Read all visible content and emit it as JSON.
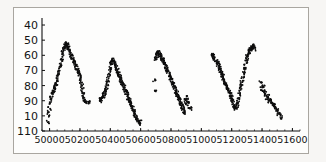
{
  "figure": {
    "background_color": "#f7f6f4",
    "plot_background_color": "#fdfdfc",
    "border_color": "#a9a6a0",
    "axis_color": "#111111",
    "point_color": "#0d0d0d"
  },
  "chart_data": {
    "type": "scatter",
    "title": "",
    "subtitle": "",
    "xlabel": "",
    "ylabel": "",
    "xlim": [
      49950,
      51650
    ],
    "ylim": [
      110,
      38
    ],
    "y_inverted": true,
    "grid": false,
    "legend": null,
    "annotations": [],
    "xticks": [
      50000,
      50200,
      50400,
      50600,
      50800,
      51000,
      51200,
      51400,
      51600
    ],
    "xticklabels": [
      "50000",
      "50200",
      "50400",
      "50600",
      "50800",
      "51000",
      "51200",
      "51400",
      "51600"
    ],
    "yticks": [
      40,
      50,
      60,
      70,
      80,
      90,
      100,
      110
    ],
    "yticklabels": [
      "40",
      "50",
      "60",
      "70",
      "80",
      "90",
      "10",
      "110"
    ],
    "series": [
      {
        "name": "light-curve",
        "marker": "dot",
        "marker_size": 1.6,
        "color": "#0d0d0d",
        "x": [
          49990,
          49993,
          49996,
          50000,
          50004,
          50008,
          50012,
          50016,
          50020,
          50024,
          50028,
          50032,
          50036,
          50040,
          50044,
          50048,
          50052,
          50056,
          50060,
          50064,
          50068,
          50072,
          50076,
          50080,
          50084,
          50088,
          50092,
          50096,
          50100,
          50104,
          50108,
          50112,
          50116,
          50120,
          50124,
          50128,
          50132,
          50136,
          50140,
          50144,
          50148,
          50152,
          50156,
          50160,
          50164,
          50168,
          50172,
          50176,
          50180,
          50184,
          50188,
          50192,
          50196,
          50200,
          50204,
          50208,
          50212,
          50216,
          50220,
          50224,
          50228,
          50232,
          50236,
          50240,
          50248,
          50258,
          50330,
          50336,
          50342,
          50346,
          50350,
          50354,
          50358,
          50362,
          50366,
          50370,
          50374,
          50378,
          50382,
          50386,
          50390,
          50394,
          50398,
          50402,
          50406,
          50410,
          50414,
          50418,
          50422,
          50426,
          50430,
          50434,
          50438,
          50442,
          50446,
          50450,
          50454,
          50458,
          50462,
          50466,
          50470,
          50474,
          50478,
          50482,
          50486,
          50490,
          50494,
          50498,
          50502,
          50506,
          50510,
          50514,
          50518,
          50522,
          50526,
          50530,
          50534,
          50538,
          50542,
          50546,
          50550,
          50554,
          50558,
          50562,
          50566,
          50570,
          50576,
          50582,
          50590,
          50596,
          50600,
          50690,
          50694,
          50698,
          50702,
          50706,
          50710,
          50714,
          50718,
          50722,
          50726,
          50730,
          50734,
          50738,
          50742,
          50746,
          50750,
          50754,
          50758,
          50762,
          50766,
          50770,
          50774,
          50778,
          50782,
          50786,
          50790,
          50794,
          50798,
          50802,
          50806,
          50810,
          50814,
          50818,
          50822,
          50826,
          50830,
          50834,
          50838,
          50842,
          50846,
          50850,
          50854,
          50858,
          50862,
          50866,
          50870,
          50874,
          50878,
          50882,
          50886,
          50890,
          50894,
          50898,
          50902,
          50906,
          50910,
          50916,
          50922,
          50928,
          51070,
          51076,
          51082,
          51088,
          51094,
          51100,
          51106,
          51110,
          51114,
          51118,
          51122,
          51126,
          51130,
          51134,
          51138,
          51142,
          51146,
          51150,
          51154,
          51158,
          51162,
          51166,
          51170,
          51174,
          51178,
          51182,
          51186,
          51190,
          51194,
          51198,
          51202,
          51206,
          51210,
          51214,
          51218,
          51222,
          51226,
          51230,
          51234,
          51238,
          51242,
          51246,
          51250,
          51254,
          51258,
          51262,
          51266,
          51270,
          51274,
          51278,
          51282,
          51286,
          51290,
          51294,
          51298,
          51302,
          51306,
          51310,
          51314,
          51318,
          51322,
          51326,
          51330,
          51334,
          51338,
          51342,
          51346,
          51350,
          51390,
          51396,
          51402,
          51408,
          51414,
          51420,
          51426,
          51432,
          51438,
          51444,
          51450,
          51456,
          51462,
          51468,
          51474,
          51480,
          51486,
          51492,
          51498,
          51504,
          51510,
          51516,
          51522
        ],
        "y": [
          104,
          100,
          97,
          95,
          91,
          89,
          88,
          86,
          85,
          84,
          83,
          82,
          81,
          80,
          79,
          78,
          76,
          74,
          72,
          70,
          68,
          66,
          64,
          62,
          60,
          58,
          56,
          55,
          54,
          53,
          52,
          52,
          53,
          54,
          55,
          56,
          57,
          58,
          59,
          60,
          61,
          62,
          63,
          64,
          65,
          66,
          67,
          68,
          69,
          70,
          71,
          72,
          73,
          74,
          76,
          78,
          80,
          82,
          84,
          86,
          88,
          89,
          90,
          90,
          91,
          91,
          89,
          90,
          89,
          88,
          87,
          87,
          86,
          85,
          84,
          83,
          82,
          80,
          78,
          76,
          74,
          72,
          70,
          68,
          66,
          64,
          63,
          63,
          64,
          65,
          66,
          67,
          68,
          69,
          70,
          71,
          72,
          73,
          74,
          75,
          76,
          77,
          78,
          79,
          80,
          81,
          82,
          83,
          84,
          85,
          86,
          87,
          88,
          89,
          90,
          91,
          92,
          93,
          94,
          95,
          96,
          97,
          98,
          99,
          100,
          101,
          102,
          103,
          104,
          104,
          105,
          76,
          84,
          63,
          62,
          60,
          59,
          58,
          58,
          59,
          60,
          60,
          61,
          62,
          62,
          63,
          63,
          64,
          65,
          66,
          67,
          68,
          69,
          70,
          71,
          72,
          73,
          74,
          75,
          76,
          77,
          78,
          79,
          80,
          81,
          82,
          83,
          84,
          85,
          86,
          87,
          88,
          89,
          90,
          91,
          92,
          93,
          94,
          95,
          96,
          97,
          98,
          92,
          90,
          89,
          88,
          90,
          92,
          94,
          95,
          59,
          60,
          61,
          62,
          63,
          64,
          65,
          66,
          67,
          68,
          69,
          70,
          71,
          72,
          73,
          74,
          75,
          76,
          77,
          78,
          79,
          80,
          81,
          82,
          83,
          84,
          85,
          86,
          87,
          88,
          89,
          90,
          92,
          93,
          94,
          95,
          95,
          94,
          93,
          92,
          90,
          88,
          86,
          84,
          82,
          80,
          78,
          76,
          74,
          72,
          70,
          68,
          66,
          64,
          62,
          61,
          60,
          59,
          58,
          57,
          56,
          56,
          55,
          55,
          54,
          54,
          55,
          56,
          78,
          80,
          82,
          81,
          83,
          85,
          86,
          88,
          87,
          89,
          90,
          90,
          91,
          92,
          92,
          93,
          94,
          95,
          96,
          97,
          99,
          100,
          101
        ],
        "scatter_jitter": 1.6,
        "n_points_approx": 290
      }
    ]
  }
}
